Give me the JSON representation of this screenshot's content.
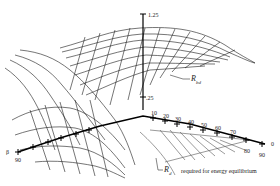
{
  "figure": {
    "colors": {
      "line": "#1a1a1a",
      "light_line": "#555555",
      "background": "#ffffff"
    }
  },
  "axes": {
    "vertical": {
      "top_label": "1.25",
      "mid_label": ".25"
    },
    "beta_axis": {
      "name": "β",
      "end_label": "90",
      "origin_label": "0"
    },
    "ticks": [
      "10",
      "20",
      "30",
      "40",
      "50",
      "60",
      "70",
      "80",
      "90"
    ]
  },
  "annotations": {
    "rbd": {
      "symbol": "R",
      "sub": "bd"
    },
    "rd": {
      "symbol": "R",
      "sub": "d",
      "text": "required for energy equilibrium"
    }
  }
}
